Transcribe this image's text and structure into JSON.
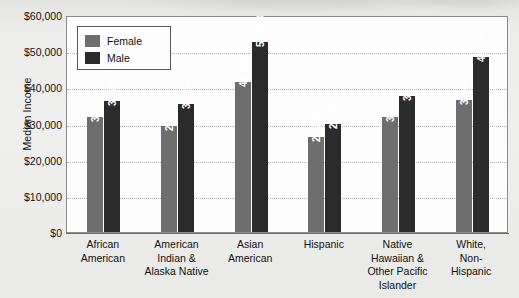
{
  "chart_data": {
    "type": "bar",
    "title": "",
    "xlabel": "",
    "ylabel": "Median Income",
    "ylim": [
      0,
      60000
    ],
    "ytick_labels": [
      "$60,000",
      "$50,000",
      "$40,000",
      "$30,000",
      "$20,000",
      "$10,000",
      "$0"
    ],
    "ytick_values": [
      60000,
      50000,
      40000,
      30000,
      20000,
      10000,
      0
    ],
    "grid": true,
    "legend_position": "top-left",
    "categories": [
      "African American",
      "American Indian & Alaska Native",
      "Asian American",
      "Hispanic",
      "Native Hawaiian & Other Pacific Islander",
      "White, Non-Hispanic"
    ],
    "category_lines": [
      [
        "African",
        "American"
      ],
      [
        "American",
        "Indian &",
        "Alaska Native"
      ],
      [
        "Asian",
        "American"
      ],
      [
        "Hispanic"
      ],
      [
        "Native",
        "Hawaiian &",
        "Other Pacific",
        "Islander"
      ],
      [
        "White,",
        "Non-",
        "Hispanic"
      ]
    ],
    "series": [
      {
        "name": "Female",
        "color": "#6e6e6e",
        "values": [
          31724,
          29443,
          41505,
          26264,
          31837,
          36429
        ],
        "labels": [
          "31,724",
          "29,443",
          "41,505",
          "26,264",
          "31,837",
          "36,429"
        ]
      },
      {
        "name": "Male",
        "color": "#2b2b2b",
        "values": [
          36290,
          35267,
          52463,
          29925,
          37487,
          48395
        ],
        "labels": [
          "36,290",
          "35,267",
          "52,463",
          "29,925",
          "37,487",
          "48,395"
        ]
      }
    ]
  },
  "legend": {
    "items": [
      {
        "label": "Female",
        "color": "#6e6e6e"
      },
      {
        "label": "Male",
        "color": "#2b2b2b"
      }
    ]
  }
}
